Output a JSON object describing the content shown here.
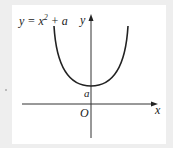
{
  "figure": {
    "equation_prefix": "y = x",
    "equation_exponent": "2",
    "equation_suffix": " + a",
    "y_axis_label": "y",
    "x_axis_label": "x",
    "origin_label": "O",
    "intercept_label": "a",
    "colors": {
      "background": "#eeeeee",
      "panel": "#ffffff",
      "curve": "#222222",
      "axes": "#333333"
    }
  }
}
